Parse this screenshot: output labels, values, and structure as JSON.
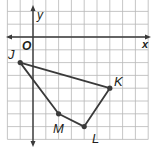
{
  "figure": {
    "type": "coordinate-plane-polygon",
    "axis_labels": {
      "x": "x",
      "y": "y",
      "origin": "O"
    },
    "grid": {
      "x_range": [
        -2,
        9
      ],
      "y_range": [
        -8,
        3
      ],
      "unit": 1
    },
    "polygon": {
      "vertices": [
        {
          "label": "J",
          "x": -1,
          "y": -2
        },
        {
          "label": "K",
          "x": 6,
          "y": -4
        },
        {
          "label": "L",
          "x": 4,
          "y": -7
        },
        {
          "label": "M",
          "x": 2,
          "y": -6
        }
      ],
      "order": [
        "J",
        "K",
        "L",
        "M"
      ]
    },
    "colors": {
      "grid": "#b8b8b8",
      "axis": "#3a3a3a",
      "polygon": "#3a3a3a",
      "point": "#3a3a3a"
    }
  }
}
